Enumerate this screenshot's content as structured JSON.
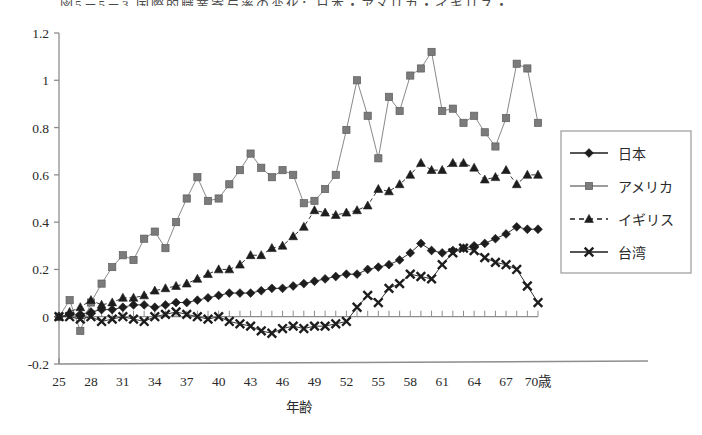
{
  "figure": {
    "title_partial": "図5－5－3 国際的職業寄与率の変化：日本・アメリカ・イギリス・台湾",
    "background": "#ffffff"
  },
  "chart_data": {
    "type": "line",
    "title": "",
    "xlabel": "年齢",
    "ylabel": "",
    "x_unit_suffix": "歳",
    "xlim": [
      25,
      70
    ],
    "ylim": [
      -0.2,
      1.2
    ],
    "ytick_labels": [
      "1.2",
      "1",
      "0.8",
      "0.6",
      "0.4",
      "0.2",
      "0",
      "-0.2"
    ],
    "ytick_values": [
      1.2,
      1.0,
      0.8,
      0.6,
      0.4,
      0.2,
      0,
      -0.2
    ],
    "xtick_labels": [
      "25",
      "28",
      "31",
      "34",
      "37",
      "40",
      "43",
      "46",
      "49",
      "52",
      "55",
      "58",
      "61",
      "64",
      "67",
      "70歳"
    ],
    "xtick_values": [
      25,
      28,
      31,
      34,
      37,
      40,
      43,
      46,
      49,
      52,
      55,
      58,
      61,
      64,
      67,
      70
    ],
    "minor_ticks": true,
    "grid": false,
    "legend_position": "right",
    "x": [
      25,
      26,
      27,
      28,
      29,
      30,
      31,
      32,
      33,
      34,
      35,
      36,
      37,
      38,
      39,
      40,
      41,
      42,
      43,
      44,
      45,
      46,
      47,
      48,
      49,
      50,
      51,
      52,
      53,
      54,
      55,
      56,
      57,
      58,
      59,
      60,
      61,
      62,
      63,
      64,
      65,
      66,
      67,
      68,
      69,
      70
    ],
    "series": [
      {
        "name": "日本",
        "marker": "diamond",
        "color": "#1d1d1d",
        "line_style": "solid",
        "values": [
          0.0,
          0.01,
          0.01,
          0.02,
          0.03,
          0.03,
          0.04,
          0.05,
          0.05,
          0.04,
          0.05,
          0.06,
          0.06,
          0.07,
          0.08,
          0.09,
          0.1,
          0.1,
          0.1,
          0.11,
          0.12,
          0.12,
          0.13,
          0.14,
          0.15,
          0.16,
          0.17,
          0.18,
          0.18,
          0.2,
          0.21,
          0.22,
          0.24,
          0.27,
          0.31,
          0.28,
          0.27,
          0.28,
          0.29,
          0.3,
          0.31,
          0.33,
          0.35,
          0.38,
          0.37,
          0.37
        ]
      },
      {
        "name": "アメリカ",
        "marker": "square",
        "color": "#7b7b7b",
        "line_style": "solid",
        "values": [
          0.0,
          0.07,
          -0.06,
          0.06,
          0.14,
          0.21,
          0.26,
          0.24,
          0.33,
          0.36,
          0.29,
          0.4,
          0.5,
          0.59,
          0.49,
          0.5,
          0.56,
          0.62,
          0.69,
          0.63,
          0.59,
          0.62,
          0.6,
          0.48,
          0.49,
          0.54,
          0.6,
          0.79,
          1.0,
          0.85,
          0.67,
          0.93,
          0.87,
          1.02,
          1.05,
          1.12,
          0.87,
          0.88,
          0.82,
          0.85,
          0.78,
          0.72,
          0.84,
          1.07,
          1.05,
          0.82
        ]
      },
      {
        "name": "イギリス",
        "marker": "triangle",
        "color": "#1d1d1d",
        "line_style": "dashed",
        "values": [
          0.0,
          0.02,
          0.04,
          0.07,
          0.05,
          0.06,
          0.08,
          0.08,
          0.09,
          0.11,
          0.12,
          0.13,
          0.14,
          0.16,
          0.18,
          0.2,
          0.2,
          0.22,
          0.26,
          0.26,
          0.29,
          0.3,
          0.34,
          0.38,
          0.45,
          0.44,
          0.43,
          0.44,
          0.45,
          0.47,
          0.54,
          0.53,
          0.56,
          0.6,
          0.65,
          0.62,
          0.62,
          0.65,
          0.65,
          0.63,
          0.58,
          0.59,
          0.62,
          0.56,
          0.6,
          0.6
        ]
      },
      {
        "name": "台湾",
        "marker": "x",
        "color": "#1d1d1d",
        "line_style": "solid",
        "values": [
          0.0,
          0.0,
          -0.01,
          0.0,
          -0.02,
          -0.01,
          0.0,
          -0.01,
          -0.02,
          0.0,
          0.01,
          0.02,
          0.01,
          0.0,
          -0.01,
          0.0,
          -0.02,
          -0.03,
          -0.04,
          -0.06,
          -0.07,
          -0.05,
          -0.04,
          -0.05,
          -0.04,
          -0.04,
          -0.03,
          -0.02,
          0.04,
          0.09,
          0.06,
          0.12,
          0.14,
          0.18,
          0.17,
          0.16,
          0.22,
          0.27,
          0.29,
          0.28,
          0.25,
          0.23,
          0.22,
          0.2,
          0.13,
          0.06
        ]
      }
    ]
  },
  "legend": {
    "items": [
      {
        "label": "日本"
      },
      {
        "label": "アメリカ"
      },
      {
        "label": "イギリス"
      },
      {
        "label": "台湾"
      }
    ]
  }
}
